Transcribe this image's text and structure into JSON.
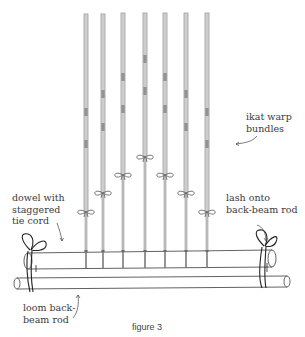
{
  "figure": {
    "caption": "figure 3",
    "colors": {
      "stick": "#9a9a9a",
      "stick_light": "#d8d8d8",
      "ink": "#333333",
      "dye_mark": "#7d7d7d"
    },
    "sticks": [
      {
        "x": 86,
        "top": 14,
        "tie_y": 212,
        "marks": [
          108,
          140
        ]
      },
      {
        "x": 103,
        "top": 14,
        "tie_y": 193,
        "marks": [
          90,
          123
        ]
      },
      {
        "x": 123,
        "top": 13,
        "tie_y": 175,
        "marks": [
          73,
          105
        ]
      },
      {
        "x": 145,
        "top": 13,
        "tie_y": 157,
        "marks": [
          55,
          87
        ]
      },
      {
        "x": 165,
        "top": 13,
        "tie_y": 175,
        "marks": [
          73,
          105
        ]
      },
      {
        "x": 186,
        "top": 13,
        "tie_y": 193,
        "marks": [
          90,
          123
        ]
      },
      {
        "x": 207,
        "top": 13,
        "tie_y": 212,
        "marks": [
          108,
          140
        ]
      }
    ]
  },
  "labels": {
    "warp_bundles": "ikat warp\nbundles",
    "dowel": "dowel with\nstaggered\ntie cord",
    "lash": "lash onto\nback-beam rod",
    "back_beam": "loom back-\nbeam rod"
  }
}
